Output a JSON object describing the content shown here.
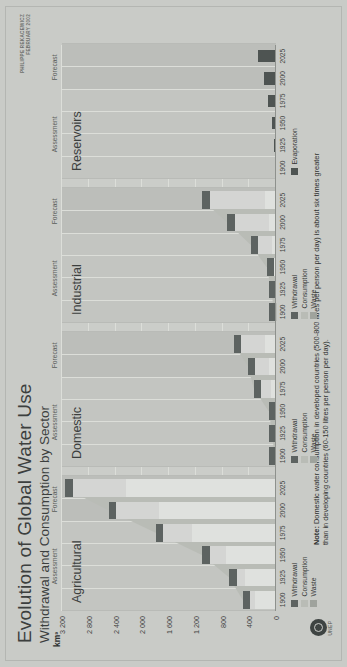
{
  "poster": {
    "title": "Evolution of Global Water Use",
    "subtitle": "Withdrawal and Consumption by Sector",
    "credit": "PHILIPPE REKACEWICZ\nFEBRUARY 2002",
    "note_label": "Note:",
    "note_text": " Domestic water consumption in developed countries (500-800 litres per person per day) is about six times greater than in developing countries (60-150 litres per person per day).",
    "logo_name": "unep-logo",
    "logo_text": "UNEP",
    "background_color": "#c9cbc7"
  },
  "axis": {
    "y_title": "km³",
    "y_ticks": [
      "3 200",
      "2 800",
      "2 400",
      "2 000",
      "1 600",
      "1 200",
      "800",
      "400",
      "0"
    ],
    "y_values": [
      3200,
      2800,
      2400,
      2000,
      1600,
      1200,
      800,
      400,
      0
    ],
    "x_ticks": [
      "1900",
      "1925",
      "1950",
      "1975",
      "2000",
      "2025"
    ],
    "phase_assessment": "Assessment",
    "phase_forecast": "Forecast"
  },
  "legend": {
    "sector_legend": [
      {
        "label": "Withdrawal",
        "color": "#5d6361",
        "key": "withdrawal"
      },
      {
        "label": "Consumption",
        "color": "#b9bcb6",
        "key": "consumption"
      },
      {
        "label": "Waste",
        "color": "#9fa39d",
        "key": "waste"
      }
    ],
    "reservoir_legend": [
      {
        "label": "Evaporation",
        "color": "#4e5452",
        "key": "evaporation"
      }
    ]
  },
  "chart_data": {
    "type": "bar",
    "title": "Evolution of Global Water Use",
    "subtitle": "Withdrawal and Consumption by Sector",
    "xlabel": "",
    "ylabel": "km³",
    "ylim": [
      0,
      3200
    ],
    "grid": true,
    "legend_position": "bottom",
    "x": [
      1900,
      1925,
      1950,
      1975,
      2000,
      2025
    ],
    "assessment_years": [
      1900,
      1925,
      1950,
      1975
    ],
    "forecast_years": [
      2000,
      2025
    ],
    "panels": [
      {
        "name": "Agricultural",
        "series": [
          {
            "name": "Withdrawal",
            "values": [
              500,
              700,
              1100,
              1800,
              2500,
              3150
            ]
          },
          {
            "name": "Consumption",
            "values": [
              320,
              470,
              750,
              1250,
              1750,
              2250
            ]
          },
          {
            "name": "Waste",
            "values": [
              180,
              230,
              350,
              550,
              750,
              900
            ]
          }
        ]
      },
      {
        "name": "Domestic",
        "series": [
          {
            "name": "Withdrawal",
            "values": [
              25,
              55,
              110,
              330,
              420,
              630
            ]
          },
          {
            "name": "Consumption",
            "values": [
              10,
              20,
              40,
              80,
              110,
              160
            ]
          },
          {
            "name": "Waste",
            "values": [
              15,
              35,
              70,
              250,
              310,
              470
            ]
          }
        ]
      },
      {
        "name": "Industrial",
        "series": [
          {
            "name": "Withdrawal",
            "values": [
              30,
              70,
              140,
              380,
              730,
              1100
            ]
          },
          {
            "name": "Consumption",
            "values": [
              5,
              12,
              25,
              60,
              110,
              170
            ]
          },
          {
            "name": "Waste",
            "values": [
              25,
              58,
              115,
              320,
              620,
              930
            ]
          }
        ]
      },
      {
        "name": "Reservoirs",
        "series": [
          {
            "name": "Evaporation",
            "values": [
              10,
              25,
              60,
              120,
              180,
              270
            ]
          }
        ]
      }
    ]
  }
}
